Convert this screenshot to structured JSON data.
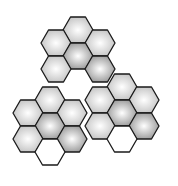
{
  "figure": {
    "background": "#ffffff",
    "stroke": "#1a1a1a",
    "hex_radius": 15,
    "shades": {
      "light": {
        "inner": "#ffffff",
        "outer": "#bdbdbd"
      },
      "dark": {
        "inner": "#ffffff",
        "outer": "#8e8e8e"
      },
      "empty": {
        "inner": "#ffffff",
        "outer": "#ffffff"
      }
    },
    "clusters": [
      {
        "name": "top-cluster",
        "hexes": [
          {
            "x": 78,
            "y": 30,
            "shade": "light"
          },
          {
            "x": 56,
            "y": 43,
            "shade": "light"
          },
          {
            "x": 100,
            "y": 43,
            "shade": "light"
          },
          {
            "x": 78,
            "y": 56,
            "shade": "dark"
          },
          {
            "x": 56,
            "y": 69,
            "shade": "light"
          },
          {
            "x": 100,
            "y": 69,
            "shade": "dark"
          }
        ]
      },
      {
        "name": "left-cluster",
        "hexes": [
          {
            "x": 50,
            "y": 100,
            "shade": "light"
          },
          {
            "x": 28,
            "y": 113,
            "shade": "light"
          },
          {
            "x": 72,
            "y": 113,
            "shade": "light"
          },
          {
            "x": 50,
            "y": 126,
            "shade": "dark"
          },
          {
            "x": 28,
            "y": 139,
            "shade": "light"
          },
          {
            "x": 72,
            "y": 139,
            "shade": "dark"
          },
          {
            "x": 50,
            "y": 152,
            "shade": "empty"
          }
        ]
      },
      {
        "name": "right-cluster",
        "hexes": [
          {
            "x": 122,
            "y": 87,
            "shade": "light"
          },
          {
            "x": 100,
            "y": 100,
            "shade": "light"
          },
          {
            "x": 144,
            "y": 100,
            "shade": "light"
          },
          {
            "x": 122,
            "y": 113,
            "shade": "dark"
          },
          {
            "x": 100,
            "y": 126,
            "shade": "light"
          },
          {
            "x": 144,
            "y": 126,
            "shade": "dark"
          },
          {
            "x": 122,
            "y": 139,
            "shade": "empty"
          }
        ]
      }
    ]
  }
}
